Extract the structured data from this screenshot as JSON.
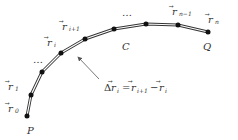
{
  "diagram": {
    "curve_label": "C",
    "start_label": "P",
    "end_label": "Q",
    "ellipsis": "…",
    "vector_glyph": "r",
    "vectors": [
      {
        "name": "r0",
        "sub": "0"
      },
      {
        "name": "r1",
        "sub": "1"
      },
      {
        "name": "ri",
        "sub": "i"
      },
      {
        "name": "ri+1",
        "sub": "i+1"
      },
      {
        "name": "rn-1",
        "sub": "n−1"
      },
      {
        "name": "rn",
        "sub": "n"
      }
    ],
    "equation": {
      "lhs_prefix": "Δ",
      "lhs_sub": "i",
      "equals": "=",
      "rhs1_sub": "i+1",
      "minus": "−",
      "rhs2_sub": "i"
    },
    "colors": {
      "curve": "#333333",
      "points": "#111111",
      "text": "#333333",
      "arrow": "#555555"
    }
  }
}
